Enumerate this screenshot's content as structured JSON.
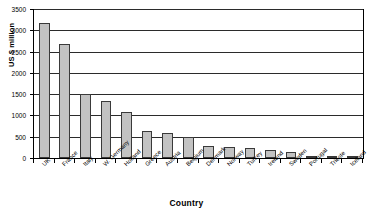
{
  "chart_data": {
    "type": "bar",
    "title": "",
    "xlabel": "Country",
    "ylabel": "US $ million",
    "categories": [
      "UK",
      "France",
      "Italy",
      "W. Germany",
      "Holland",
      "Greece",
      "Austria",
      "Belgium",
      "Denmark",
      "Norway",
      "Turkey",
      "Ireland",
      "Sweden",
      "Portugal",
      "Trieste",
      "Iceland"
    ],
    "values": [
      3180,
      2680,
      1500,
      1330,
      1080,
      630,
      580,
      500,
      280,
      260,
      230,
      200,
      130,
      40,
      30,
      25
    ],
    "ylim": [
      0,
      3500
    ],
    "yticks": [
      0,
      500,
      1000,
      1500,
      2000,
      2500,
      3000,
      3500
    ],
    "ytick_labels": [
      "0",
      "500",
      "1000",
      "1500",
      "2000",
      "2500",
      "3000",
      "3500"
    ],
    "grid": true,
    "legend": "none",
    "bar_color": "#c2c2c2",
    "bar_edge_color": "#3a3a3a",
    "axis_color": "#000000"
  }
}
